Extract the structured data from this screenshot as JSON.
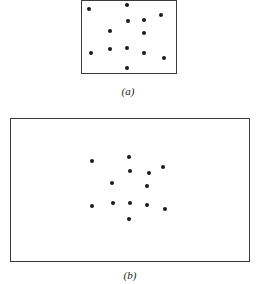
{
  "figure": {
    "panels": [
      {
        "id": "a",
        "label": "(a)",
        "box": {
          "left": 81,
          "top": 0,
          "width": 96,
          "height": 74
        },
        "label_pos": {
          "x": 128,
          "y": 85
        },
        "dots": [
          {
            "x": 89,
            "y": 9
          },
          {
            "x": 127,
            "y": 5
          },
          {
            "x": 161,
            "y": 15
          },
          {
            "x": 128,
            "y": 21
          },
          {
            "x": 144,
            "y": 20
          },
          {
            "x": 110,
            "y": 31
          },
          {
            "x": 144,
            "y": 33
          },
          {
            "x": 91,
            "y": 53
          },
          {
            "x": 110,
            "y": 49
          },
          {
            "x": 127,
            "y": 48
          },
          {
            "x": 144,
            "y": 53
          },
          {
            "x": 164,
            "y": 58
          },
          {
            "x": 127,
            "y": 68
          }
        ]
      },
      {
        "id": "b",
        "label": "(b)",
        "box": {
          "left": 10,
          "top": 118,
          "width": 240,
          "height": 144
        },
        "label_pos": {
          "x": 130,
          "y": 269
        },
        "dots": [
          {
            "x": 92,
            "y": 161
          },
          {
            "x": 129,
            "y": 157
          },
          {
            "x": 130,
            "y": 171
          },
          {
            "x": 149,
            "y": 173
          },
          {
            "x": 163,
            "y": 167
          },
          {
            "x": 112,
            "y": 183
          },
          {
            "x": 147,
            "y": 186
          },
          {
            "x": 92,
            "y": 206
          },
          {
            "x": 113,
            "y": 203
          },
          {
            "x": 130,
            "y": 203
          },
          {
            "x": 147,
            "y": 205
          },
          {
            "x": 165,
            "y": 209
          },
          {
            "x": 129,
            "y": 219
          }
        ]
      }
    ]
  }
}
